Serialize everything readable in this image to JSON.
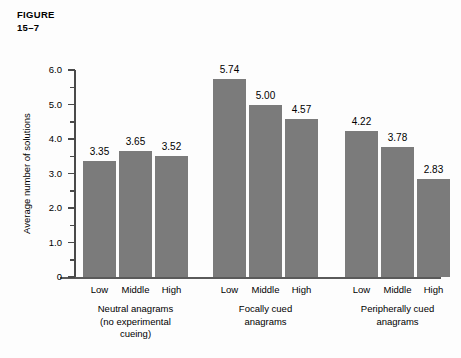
{
  "figure": {
    "label_line1": "FIGURE",
    "label_line2": "15–7"
  },
  "chart_data": {
    "type": "bar",
    "title": "FIGURE 15–7",
    "xlabel": "",
    "ylabel": "Average number of solutions",
    "ylim": [
      0,
      6.0
    ],
    "y_major_ticks": [
      "0",
      "1.0",
      "2.0",
      "3.0",
      "4.0",
      "5.0",
      "6.0"
    ],
    "y_major_values": [
      0,
      1.0,
      2.0,
      3.0,
      4.0,
      5.0,
      6.0
    ],
    "y_minor_values": [
      0.5,
      1.5,
      2.5,
      3.5,
      4.5,
      5.5
    ],
    "grid": false,
    "legend": "none",
    "categories": [
      "Low",
      "Middle",
      "High"
    ],
    "groups": [
      {
        "name": "Neutral anagrams (no experimental cueing)",
        "caption_lines": [
          "Neutral anagrams",
          "(no experimental",
          "cueing)"
        ],
        "bars": [
          {
            "category": "Low",
            "value": 3.35,
            "label": "3.35"
          },
          {
            "category": "Middle",
            "value": 3.65,
            "label": "3.65"
          },
          {
            "category": "High",
            "value": 3.52,
            "label": "3.52"
          }
        ]
      },
      {
        "name": "Focally cued anagrams",
        "caption_lines": [
          "Focally cued",
          "anagrams"
        ],
        "bars": [
          {
            "category": "Low",
            "value": 5.74,
            "label": "5.74"
          },
          {
            "category": "Middle",
            "value": 5.0,
            "label": "5.00"
          },
          {
            "category": "High",
            "value": 4.57,
            "label": "4.57"
          }
        ]
      },
      {
        "name": "Peripherally cued anagrams",
        "caption_lines": [
          "Peripherally cued",
          "anagrams"
        ],
        "bars": [
          {
            "category": "Low",
            "value": 4.22,
            "label": "4.22"
          },
          {
            "category": "Middle",
            "value": 3.78,
            "label": "3.78"
          },
          {
            "category": "High",
            "value": 2.83,
            "label": "2.83"
          }
        ]
      }
    ],
    "colors": {
      "bar_fill": "#7b7b7b",
      "axis": "#4a4a4a",
      "text": "#000000",
      "background": "#fdfdfd"
    }
  }
}
